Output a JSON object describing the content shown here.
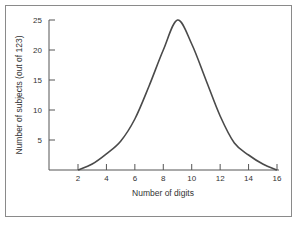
{
  "chart_data": {
    "type": "line",
    "title": "",
    "xlabel": "Number of digits",
    "ylabel": "Number of subjects (out of 123)",
    "x": [
      2,
      3,
      4,
      5,
      6,
      7,
      8,
      9,
      10,
      11,
      12,
      13,
      14,
      15,
      16
    ],
    "series": [
      {
        "name": "distribution",
        "values": [
          0,
          1,
          2.7,
          4.8,
          8.5,
          14,
          20,
          25,
          21,
          15,
          9,
          4.5,
          2.5,
          1,
          0
        ]
      }
    ],
    "xticks": [
      "2",
      "4",
      "6",
      "8",
      "10",
      "12",
      "14",
      "16"
    ],
    "yticks": [
      "5",
      "10",
      "15",
      "20",
      "25"
    ],
    "xlim": [
      0,
      16
    ],
    "ylim": [
      0,
      25
    ],
    "grid": false,
    "legend": "none",
    "colors": {
      "line": "#4a4a4a",
      "axis": "#555555",
      "frame": "#8a8a8a"
    }
  }
}
